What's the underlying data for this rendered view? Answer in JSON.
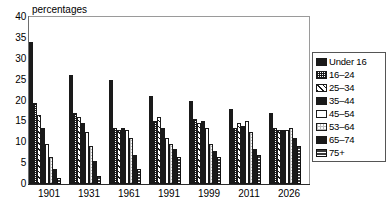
{
  "chart_data": {
    "type": "bar",
    "title": "percentages",
    "xlabel": "",
    "ylabel": "percentages",
    "ylim": [
      0,
      40
    ],
    "ytick_step": 5,
    "yticks": [
      40,
      35,
      30,
      25,
      20,
      15,
      10,
      5,
      0
    ],
    "grid": false,
    "legend_position": "right",
    "categories": [
      "1901",
      "1931",
      "1961",
      "1991",
      "1999",
      "2011",
      "2026"
    ],
    "series": [
      {
        "name": "Under 16",
        "pattern": "solid-black",
        "values": [
          34.0,
          26.0,
          25.0,
          21.0,
          20.0,
          18.0,
          17.0
        ]
      },
      {
        "name": "16–24",
        "pattern": "dense-grid",
        "values": [
          19.5,
          17.0,
          13.5,
          15.0,
          15.5,
          13.5,
          13.5
        ]
      },
      {
        "name": "25–34",
        "pattern": "diagonal-hatch",
        "values": [
          16.5,
          16.0,
          13.0,
          16.0,
          14.5,
          14.5,
          13.0
        ]
      },
      {
        "name": "35–44",
        "pattern": "solid-black",
        "values": [
          13.5,
          14.5,
          13.5,
          13.5,
          15.0,
          14.0,
          13.0
        ]
      },
      {
        "name": "45–54",
        "pattern": "white-empty",
        "values": [
          9.5,
          12.5,
          13.0,
          11.0,
          13.5,
          15.0,
          13.0
        ]
      },
      {
        "name": "53–64",
        "pattern": "light-dots",
        "values": [
          6.5,
          9.0,
          11.0,
          9.5,
          9.5,
          12.5,
          13.5
        ]
      },
      {
        "name": "65–74",
        "pattern": "solid-black",
        "values": [
          3.5,
          5.5,
          7.0,
          8.5,
          8.0,
          8.5,
          11.0
        ]
      },
      {
        "name": "75+",
        "pattern": "cross-hatch",
        "values": [
          1.5,
          2.0,
          3.5,
          6.5,
          6.5,
          7.0,
          9.0
        ]
      }
    ]
  },
  "axis": {
    "title": "percentages",
    "y_tick_labels": [
      "40",
      "35",
      "30",
      "25",
      "20",
      "15",
      "10",
      "5",
      "0"
    ],
    "x_tick_labels": [
      "1901",
      "1931",
      "1961",
      "1991",
      "1999",
      "2011",
      "2026"
    ]
  },
  "legend": {
    "items": [
      {
        "label": "Under 16",
        "swatch": "solid-black-swatch"
      },
      {
        "label": "16–24",
        "swatch": "dense-grid-swatch"
      },
      {
        "label": "25–34",
        "swatch": "diagonal-hatch-swatch"
      },
      {
        "label": "35–44",
        "swatch": "solid-black-swatch"
      },
      {
        "label": "45–54",
        "swatch": "white-empty-swatch"
      },
      {
        "label": "53–64",
        "swatch": "light-dots-swatch"
      },
      {
        "label": "65–74",
        "swatch": "solid-black-swatch"
      },
      {
        "label": "75+",
        "swatch": "cross-hatch-swatch"
      }
    ]
  },
  "colors": {
    "bar_dark": "#1a1a1a",
    "axis": "#2b2b2b",
    "frame": "#9a9a9a",
    "background": "#ffffff"
  }
}
